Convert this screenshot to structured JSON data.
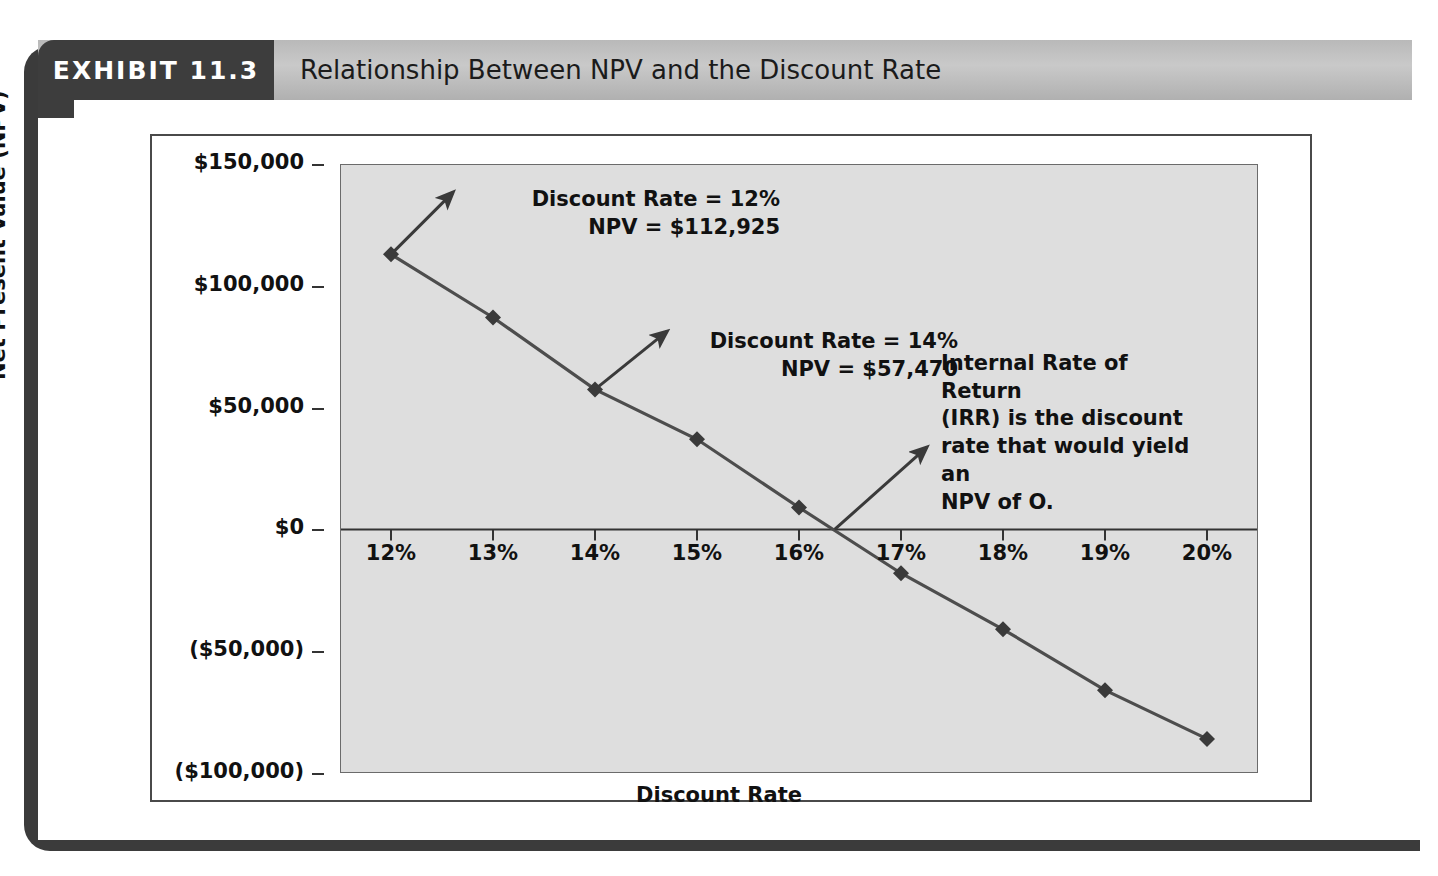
{
  "exhibit": {
    "badge_label": "EXHIBIT 11.3",
    "title": "Relationship Between NPV and the Discount Rate"
  },
  "chart_data": {
    "type": "line",
    "title": "Relationship Between NPV and the Discount Rate",
    "xlabel": "Discount Rate",
    "ylabel": "Net Present Value (NPV)",
    "categories": [
      "12%",
      "13%",
      "14%",
      "15%",
      "16%",
      "17%",
      "18%",
      "19%",
      "20%"
    ],
    "x": [
      12,
      13,
      14,
      15,
      16,
      17,
      18,
      19,
      20
    ],
    "values": [
      112925,
      87000,
      57470,
      37000,
      9000,
      -18000,
      -41000,
      -66000,
      -86000
    ],
    "series": [
      {
        "name": "NPV",
        "values": [
          112925,
          87000,
          57470,
          37000,
          9000,
          -18000,
          -41000,
          -66000,
          -86000
        ]
      }
    ],
    "ylim": [
      -100000,
      150000
    ],
    "xlim": [
      11.5,
      20.5
    ],
    "ytick_values": [
      150000,
      100000,
      50000,
      0,
      -50000,
      -100000
    ],
    "ytick_labels": [
      "$150,000",
      "$100,000",
      "$50,000",
      "$0",
      "($50,000)",
      "($100,000)"
    ],
    "xtick_labels": [
      "12%",
      "13%",
      "14%",
      "15%",
      "16%",
      "17%",
      "18%",
      "19%",
      "20%"
    ],
    "grid": false,
    "legend": "none",
    "marker": "diamond",
    "line_color": "#4d4d4d",
    "marker_color": "#3a3a3a",
    "plot_background": "#dedede",
    "zero_line": 0,
    "annotations": [
      {
        "name": "annotation-12-percent",
        "text": "Discount Rate = 12%\nNPV = $112,925",
        "points_to_x": 12,
        "points_to_y": 112925
      },
      {
        "name": "annotation-14-percent",
        "text": "Discount Rate = 14%\nNPV = $57,470",
        "points_to_x": 14,
        "points_to_y": 57470
      },
      {
        "name": "annotation-irr",
        "text": "Internal Rate of Return\n(IRR) is the discount\nrate that would yield an\nNPV of O.",
        "points_to_x": 16.35,
        "points_to_y": 0
      }
    ]
  },
  "colors": {
    "badge_background": "#3d3d3d",
    "header_band": "#c2c2c2",
    "text": "#111111",
    "frame": "#4a4a4a"
  }
}
